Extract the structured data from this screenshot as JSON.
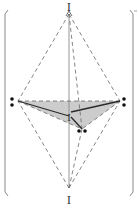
{
  "diagram": {
    "labels": {
      "top": "I",
      "bottom": "I",
      "center": "I"
    },
    "colors": {
      "shade": "#cccccc",
      "solid_line": "#2a2a2a",
      "dashed_line": "#666666",
      "axis_line": "#8a8a8a",
      "bracket": "#8a8a8a",
      "dot": "#111111"
    },
    "vertices": {
      "top": [
        69,
        14
      ],
      "bottom": [
        69,
        188
      ],
      "left": [
        18,
        101
      ],
      "right": [
        120,
        101
      ],
      "center": [
        69,
        116
      ],
      "lower": [
        82,
        129
      ]
    },
    "dots": [
      {
        "name": "left-dot-upper",
        "x": 12,
        "y": 99
      },
      {
        "name": "left-dot-lower",
        "x": 12,
        "y": 105
      },
      {
        "name": "right-dot-upper",
        "x": 124,
        "y": 99
      },
      {
        "name": "right-dot-lower",
        "x": 124,
        "y": 105
      },
      {
        "name": "lower-dot-left",
        "x": 79,
        "y": 131
      },
      {
        "name": "lower-dot-right",
        "x": 85,
        "y": 131
      }
    ]
  }
}
